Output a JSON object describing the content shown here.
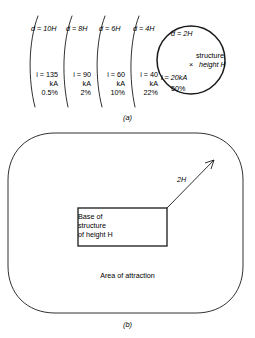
{
  "figure": {
    "panel_a": {
      "caption": "(a)",
      "arcs": [
        {
          "distance_label": "d = 10H",
          "current": "i = 135",
          "unit": "kA",
          "percent": "0.5%"
        },
        {
          "distance_label": "d = 8H",
          "current": "i = 90",
          "unit": "kA",
          "percent": "2%"
        },
        {
          "distance_label": "d = 6H",
          "current": "i = 60",
          "unit": "kA",
          "percent": "10%"
        },
        {
          "distance_label": "d = 4H",
          "current": "i = 40",
          "unit": "kA",
          "percent": "22%"
        }
      ],
      "circle": {
        "distance_label": "d = 2H",
        "current": "i = 20kA",
        "percent": "50%",
        "marker": "×",
        "structure_line1": "structure",
        "structure_line2": "height H"
      }
    },
    "panel_b": {
      "caption": "(b)",
      "area_label": "Area of attraction",
      "base_line1": "Base of",
      "base_line2": "structure",
      "base_line3": "of height H",
      "arrow_label": "2H"
    }
  },
  "style": {
    "stroke": "#1a1a1a",
    "background": "#ffffff"
  }
}
